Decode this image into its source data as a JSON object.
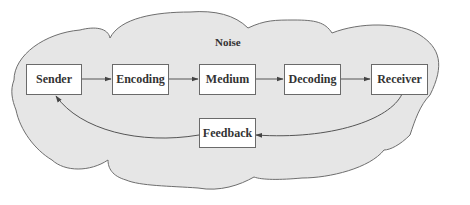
{
  "diagram": {
    "noise_label": "Noise",
    "nodes": {
      "sender": "Sender",
      "encoding": "Encoding",
      "medium": "Medium",
      "decoding": "Decoding",
      "receiver": "Receiver",
      "feedback": "Feedback"
    },
    "edges": [
      {
        "from": "Sender",
        "to": "Encoding"
      },
      {
        "from": "Encoding",
        "to": "Medium"
      },
      {
        "from": "Medium",
        "to": "Decoding"
      },
      {
        "from": "Decoding",
        "to": "Receiver"
      },
      {
        "from": "Receiver",
        "to": "Feedback"
      },
      {
        "from": "Feedback",
        "to": "Sender"
      }
    ],
    "colors": {
      "cloud_fill": "#e6e6e6",
      "cloud_stroke": "#6e6e6e",
      "box_fill": "#ffffff",
      "line": "#555555",
      "text": "#333333"
    }
  }
}
